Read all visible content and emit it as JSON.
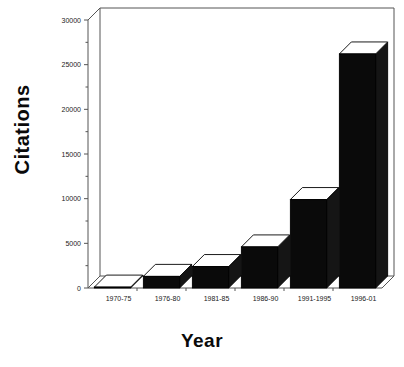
{
  "chart_data": {
    "type": "bar",
    "title": "",
    "subtitle": "",
    "xlabel": "Year",
    "ylabel": "Citations",
    "categories": [
      "1970-75",
      "1976-80",
      "1981-85",
      "1986-90",
      "1991-1995",
      "1996-01"
    ],
    "values": [
      100,
      1300,
      2400,
      4600,
      9900,
      26200
    ],
    "series": [
      {
        "name": "Citations",
        "values": [
          100,
          1300,
          2400,
          4600,
          9900,
          26200
        ]
      }
    ],
    "ylim": [
      0,
      30000
    ],
    "y_major_ticks": [
      0,
      5000,
      10000,
      15000,
      20000,
      25000,
      30000
    ],
    "y_tick_labels": [
      "0",
      "5000",
      "10000",
      "15000",
      "20000",
      "25000",
      "30000"
    ],
    "y_minor_ticks": [
      2500,
      7500,
      12500,
      17500,
      22500,
      27500
    ],
    "grid": false,
    "legend": false,
    "legend_position": "none",
    "annotations": [],
    "style": {
      "bar_face_color": "#0a0a0a",
      "bar_top_color": "#ffffff",
      "bar_side_color": "#151515",
      "bar_edge_color": "#000000",
      "axis_color": "#555555",
      "background_color": "#ffffff",
      "text_color": "#0a0a0a",
      "three_d": true
    }
  },
  "axis_titles": {
    "y": "Citations",
    "x": "Year"
  }
}
